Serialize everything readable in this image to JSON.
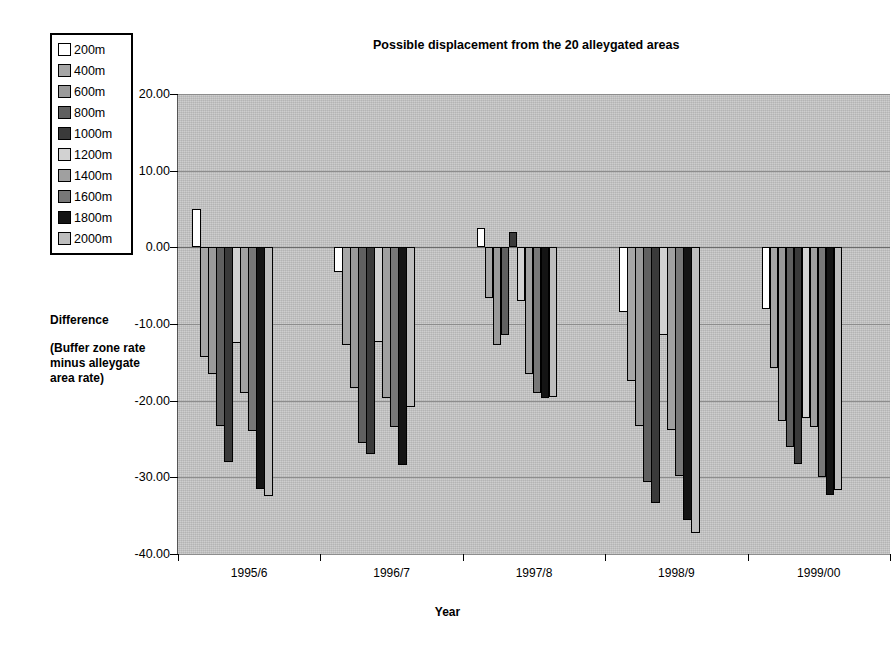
{
  "chart": {
    "title": "Possible displacement from the 20 alleygated areas",
    "xlabel": "Year",
    "ylabel_line1": "Difference",
    "ylabel_line2": "(Buffer zone rate minus alleygate area rate)"
  },
  "legend": {
    "items": [
      {
        "label": "200m",
        "color": "#ffffff"
      },
      {
        "label": "400m",
        "color": "#a6a6a6"
      },
      {
        "label": "600m",
        "color": "#9a9a9a"
      },
      {
        "label": "800m",
        "color": "#606060"
      },
      {
        "label": "1000m",
        "color": "#3a3a3a"
      },
      {
        "label": "1200m",
        "color": "#d2d2d2"
      },
      {
        "label": "1400m",
        "color": "#a0a0a0"
      },
      {
        "label": "1600m",
        "color": "#787878"
      },
      {
        "label": "1800m",
        "color": "#141414"
      },
      {
        "label": "2000m",
        "color": "#bdbdbd"
      }
    ]
  },
  "chart_data": {
    "type": "bar",
    "title": "Possible displacement from the 20 alleygated areas",
    "xlabel": "Year",
    "ylabel": "Difference (Buffer zone rate minus alleygate area rate)",
    "categories": [
      "1995/6",
      "1996/7",
      "1997/8",
      "1998/9",
      "1999/00"
    ],
    "ylim": [
      -40,
      20
    ],
    "ytick_labels": [
      "20.00",
      "10.00",
      "0.00",
      "-10.00",
      "-20.00",
      "-30.00",
      "-40.00"
    ],
    "ytick_values": [
      20,
      10,
      0,
      -10,
      -20,
      -30,
      -40
    ],
    "grid": true,
    "legend_position": "top-left-outside",
    "series": [
      {
        "name": "200m",
        "values": [
          5.0,
          -3.2,
          2.5,
          -8.5,
          -8.0
        ]
      },
      {
        "name": "400m",
        "values": [
          -14.3,
          -12.8,
          -6.6,
          -17.5,
          -15.8
        ]
      },
      {
        "name": "600m",
        "values": [
          -16.5,
          -18.3,
          -12.8,
          -23.3,
          -22.7
        ]
      },
      {
        "name": "800m",
        "values": [
          -23.3,
          -25.5,
          -11.5,
          -30.6,
          -26.1
        ]
      },
      {
        "name": "1000m",
        "values": [
          -28.0,
          -27.0,
          2.0,
          -33.4,
          -28.3
        ]
      },
      {
        "name": "1200m",
        "values": [
          -12.5,
          -12.3,
          -7.0,
          -11.5,
          -22.2
        ]
      },
      {
        "name": "1400m",
        "values": [
          -19.0,
          -19.6,
          -16.5,
          -23.8,
          -23.5
        ]
      },
      {
        "name": "1600m",
        "values": [
          -24.0,
          -23.5,
          -19.0,
          -29.8,
          -30.0
        ]
      },
      {
        "name": "1800m",
        "values": [
          -31.5,
          -28.4,
          -19.6,
          -35.6,
          -32.3
        ]
      },
      {
        "name": "2000m",
        "values": [
          -32.5,
          -20.8,
          -19.5,
          -37.3,
          -31.7
        ]
      }
    ]
  }
}
